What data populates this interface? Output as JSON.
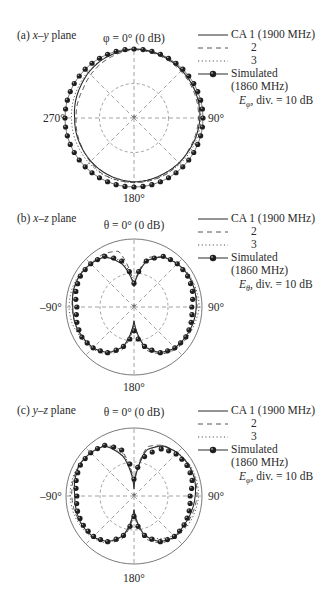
{
  "figure": {
    "colors": {
      "ink": "#2a2a2a",
      "grid": "#8a8a8a",
      "marker": "#1e1e1e",
      "background": "#ffffff"
    }
  },
  "legend": {
    "entries": [
      {
        "label": "CA 1 (1900 MHz)",
        "style": "solid"
      },
      {
        "label": "2",
        "style": "dashed"
      },
      {
        "label": "3",
        "style": "dotted"
      },
      {
        "label": "Simulated",
        "label2": "(1860 MHz)",
        "style": "marker-line"
      }
    ],
    "scale_suffix": ", div. = 10 dB"
  },
  "panels": [
    {
      "label_prefix": "(a) ",
      "label_plane": "x–y",
      "label_suffix": " plane",
      "top_label": "φ = 0° (0 dB)",
      "left_label": "270°",
      "right_label": "90°",
      "bottom_label": "180°",
      "field_symbol": "E",
      "field_sub": "φ"
    },
    {
      "label_prefix": "(b) ",
      "label_plane": "x–z",
      "label_suffix": " plane",
      "top_label": "θ = 0° (0 dB)",
      "left_label": "–90°",
      "right_label": "90°",
      "bottom_label": "180°",
      "field_symbol": "E",
      "field_sub": "θ"
    },
    {
      "label_prefix": "(c) ",
      "label_plane": "y–z",
      "label_suffix": " plane",
      "top_label": "θ = 0° (0 dB)",
      "left_label": "–90°",
      "right_label": "90°",
      "bottom_label": "180°",
      "field_symbol": "E",
      "field_sub": "φ"
    }
  ],
  "chart_data": [
    {
      "type": "polar",
      "title": "(a) x–y plane",
      "reference_label": "φ = 0° (0 dB)",
      "angle_labels": {
        "0": "φ = 0°",
        "90": "90°",
        "180": "180°",
        "270": "270°"
      },
      "radial_unit": "dB",
      "radial_range": [
        -20,
        0
      ],
      "radial_division_dB": 10,
      "grid": {
        "circles_dB": [
          -10,
          0
        ],
        "spokes_deg": [
          0,
          45,
          90,
          135,
          180,
          225,
          270,
          315
        ]
      },
      "legend_position": "right",
      "field": "Eφ",
      "angles_deg": [
        0,
        30,
        60,
        90,
        120,
        150,
        180,
        210,
        240,
        270,
        300,
        330
      ],
      "series": [
        {
          "name": "CA 1 (1900 MHz)",
          "style": "solid",
          "values_dB": [
            0,
            -0.3,
            -0.6,
            -0.9,
            -1.5,
            -1.7,
            -1.5,
            -2.0,
            -2.6,
            -2.8,
            -2.0,
            -0.8
          ]
        },
        {
          "name": "2",
          "style": "dashed",
          "values_dB": [
            -0.2,
            -0.6,
            -1.0,
            -1.3,
            -1.7,
            -1.2,
            -1.3,
            -1.4,
            -2.7,
            -3.2,
            -3.0,
            -1.5
          ]
        },
        {
          "name": "3",
          "style": "dotted",
          "values_dB": [
            -0.1,
            -0.3,
            -0.5,
            -0.6,
            -1.0,
            -1.4,
            -1.3,
            -1.3,
            -1.8,
            -1.9,
            -1.5,
            -0.7
          ]
        },
        {
          "name": "Simulated (1860 MHz)",
          "style": "marker-line",
          "values_dB": [
            0,
            0,
            0,
            0,
            0,
            0,
            0,
            0,
            0,
            0,
            0,
            0
          ]
        }
      ]
    },
    {
      "type": "polar",
      "title": "(b) x–z plane",
      "reference_label": "θ = 0° (0 dB)",
      "angle_labels": {
        "0": "θ = 0°",
        "90": "90°",
        "180": "180°",
        "-90": "–90°"
      },
      "radial_unit": "dB",
      "radial_range": [
        -20,
        0
      ],
      "radial_division_dB": 10,
      "grid": {
        "circles_dB": [
          -10,
          0
        ],
        "spokes_deg": [
          0,
          45,
          90,
          135,
          180,
          225,
          270,
          315
        ]
      },
      "legend_position": "right",
      "field": "Eθ",
      "angles_deg": [
        0,
        15,
        30,
        45,
        60,
        75,
        90,
        105,
        120,
        135,
        150,
        165,
        180,
        195,
        210,
        225,
        240,
        255,
        270,
        285,
        300,
        315,
        330,
        345
      ],
      "series": [
        {
          "name": "CA 1 (1900 MHz)",
          "style": "solid",
          "values_dB": [
            -14,
            -6,
            -3,
            -2,
            -1.5,
            -1.5,
            -1.7,
            -2,
            -2.5,
            -3,
            -4.5,
            -8,
            -16,
            -8,
            -4.5,
            -3,
            -2.5,
            -2,
            -2,
            -1.5,
            -1.5,
            -2,
            -3,
            -7
          ]
        },
        {
          "name": "2",
          "style": "dashed",
          "values_dB": [
            -14,
            -5,
            -3,
            -2,
            -1.3,
            -1.3,
            -1.5,
            -2,
            -2,
            -2.5,
            -4,
            -7,
            -15,
            -7,
            -4,
            -3,
            -2.2,
            -2,
            -1.8,
            -1.6,
            -1.5,
            -2,
            -2,
            -3
          ]
        },
        {
          "name": "3",
          "style": "dotted",
          "values_dB": [
            -13,
            -6,
            -3,
            -2,
            -1.2,
            -1,
            -0.8,
            -1.5,
            -2,
            -2.6,
            -4,
            -8,
            -15,
            -8,
            -4,
            -2.6,
            -2,
            -1.2,
            -0.9,
            -1,
            -1.2,
            -2,
            -3,
            -6
          ]
        },
        {
          "name": "Simulated (1860 MHz)",
          "style": "marker-line",
          "values_dB": [
            -13,
            -6,
            -2.8,
            -2,
            -1.8,
            -2.2,
            -3,
            -2.6,
            -2.4,
            -3,
            -4.5,
            -8,
            -13,
            -8,
            -4.5,
            -3,
            -2.3,
            -2.6,
            -3.2,
            -2.3,
            -1.8,
            -2,
            -2.8,
            -6
          ]
        }
      ]
    },
    {
      "type": "polar",
      "title": "(c) y–z plane",
      "reference_label": "θ = 0° (0 dB)",
      "angle_labels": {
        "0": "θ = 0°",
        "90": "90°",
        "180": "180°",
        "-90": "–90°"
      },
      "radial_unit": "dB",
      "radial_range": [
        -20,
        0
      ],
      "radial_division_dB": 10,
      "grid": {
        "circles_dB": [
          -10,
          0
        ],
        "spokes_deg": [
          0,
          45,
          90,
          135,
          180,
          225,
          270,
          315
        ]
      },
      "legend_position": "right",
      "field": "Eφ",
      "angles_deg": [
        0,
        15,
        30,
        45,
        60,
        75,
        90,
        105,
        120,
        135,
        150,
        165,
        180,
        195,
        210,
        225,
        240,
        255,
        270,
        285,
        300,
        315,
        330,
        345
      ],
      "series": [
        {
          "name": "CA 1 (1900 MHz)",
          "style": "solid",
          "values_dB": [
            -18,
            -6,
            -3,
            -2,
            -1.5,
            -1.5,
            -2,
            -2.5,
            -3,
            -3,
            -4.5,
            -8,
            -16,
            -8,
            -4.5,
            -3,
            -2.5,
            -2.5,
            -2.6,
            -2,
            -1.5,
            -2,
            -3,
            -8
          ]
        },
        {
          "name": "2",
          "style": "dashed",
          "values_dB": [
            -17,
            -5,
            -2.8,
            -2,
            -1.5,
            -1.3,
            -1.5,
            -2,
            -2.5,
            -2.8,
            -4,
            -7,
            -15,
            -7,
            -4,
            -3,
            -2.5,
            -2,
            -1.7,
            -1.5,
            -1.5,
            -2,
            -2.8,
            -6
          ]
        },
        {
          "name": "3",
          "style": "dotted",
          "values_dB": [
            -16,
            -6,
            -3,
            -2,
            -1.2,
            -1,
            -1,
            -1.5,
            -2,
            -3.5,
            -5.5,
            -8,
            -16,
            -8,
            -4,
            -2.6,
            -2,
            -1.5,
            -1.2,
            -1.2,
            -1.4,
            -2,
            -3,
            -7
          ]
        },
        {
          "name": "Simulated (1860 MHz)",
          "style": "marker-line",
          "values_dB": [
            -15,
            -8,
            -4,
            -2.5,
            -2,
            -2.3,
            -3.5,
            -3.2,
            -3,
            -3.2,
            -4.5,
            -8,
            -14,
            -8,
            -4.5,
            -3.2,
            -2.8,
            -2.8,
            -3.2,
            -2.4,
            -1.8,
            -2,
            -2.8,
            -6
          ]
        }
      ]
    }
  ]
}
